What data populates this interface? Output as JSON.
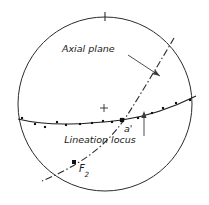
{
  "figure": {
    "width": 209,
    "height": 205,
    "background_color": "#ffffff",
    "line_color": "#1a1a1a",
    "point_color": "#111111"
  },
  "primitive_circle": {
    "name": "primitive-circle",
    "center_x": 105,
    "center_y": 104,
    "radius": 87,
    "stroke_color": "#2b2b2b",
    "stroke_width": 1
  },
  "north_tick": {
    "name": "north-tick",
    "x": 105,
    "y_top": 12,
    "y_bottom": 21
  },
  "center_cross": {
    "name": "center-cross",
    "x": 104,
    "y": 108,
    "size": 4
  },
  "labels": {
    "axial_plane": {
      "text": "Axial  plane",
      "x": 62,
      "y": 52,
      "font_size": 9.5
    },
    "lineation_locus": {
      "text": "Lineation   locus",
      "x": 100,
      "y": 143,
      "font_size": 9.5
    },
    "a_prime": {
      "text": "a'",
      "x": 124,
      "y": 132,
      "font_size": 9.5
    },
    "f2": {
      "text": "F",
      "subscript": "2",
      "x": 79,
      "y": 172,
      "font_size": 10
    }
  },
  "leaders": {
    "axial_plane_leader": {
      "name": "axial-plane-leader",
      "path": "M 128,55 L 160,76",
      "arrow_x": 160,
      "arrow_y": 76,
      "arrow_angle": 33
    },
    "lineation_leader": {
      "name": "lineation-locus-leader",
      "path": "M 144,136 L 144,113",
      "arrow_x": 144,
      "arrow_y": 111,
      "arrow_angle": -90
    }
  },
  "curves": {
    "lineation_locus_curve": {
      "name": "lineation-locus-curve",
      "style": "solid",
      "path": "M 18,119 C 50,127 88,124 122,120 C 150,116 178,105 196,96",
      "stroke_width": 1.1
    },
    "axial_plane_curve": {
      "name": "axial-plane-curve",
      "style": "dash-dot",
      "path": "M 174,38 C 160,62 142,92 128,114 C 112,138 92,160 42,181",
      "stroke_width": 1.1,
      "dash_pattern": "7,2.5,1.5,2.5"
    }
  },
  "key_points": [
    {
      "name": "point-a-prime",
      "label": "a'",
      "x": 122,
      "y": 120,
      "size": 4.2
    },
    {
      "name": "point-f2",
      "label": "F2",
      "x": 74,
      "y": 162,
      "size": 4.0
    }
  ],
  "data_points": {
    "name": "lineation-data-points",
    "count": 14,
    "marker_size": 2.1,
    "points": [
      {
        "x": 22,
        "y": 118
      },
      {
        "x": 35,
        "y": 124
      },
      {
        "x": 45,
        "y": 127
      },
      {
        "x": 57,
        "y": 122
      },
      {
        "x": 66,
        "y": 125
      },
      {
        "x": 80,
        "y": 124
      },
      {
        "x": 92,
        "y": 123
      },
      {
        "x": 103,
        "y": 121
      },
      {
        "x": 112,
        "y": 122
      },
      {
        "x": 138,
        "y": 118
      },
      {
        "x": 152,
        "y": 113
      },
      {
        "x": 163,
        "y": 108
      },
      {
        "x": 176,
        "y": 103
      },
      {
        "x": 190,
        "y": 100
      }
    ]
  },
  "chart_data": {
    "type": "scatter",
    "projection": "equal-area stereonet (lower hemisphere)",
    "xlabel": "",
    "ylabel": "",
    "grid": false,
    "legend_position": "inline-annotations",
    "annotations": [
      "Axial  plane",
      "Lineation   locus",
      "a'",
      "F2"
    ],
    "series": [
      {
        "name": "lineation measurements",
        "marker": "filled-square",
        "values": [
          [
            22,
            118
          ],
          [
            35,
            124
          ],
          [
            45,
            127
          ],
          [
            57,
            122
          ],
          [
            66,
            125
          ],
          [
            80,
            124
          ],
          [
            92,
            123
          ],
          [
            103,
            121
          ],
          [
            112,
            122
          ],
          [
            138,
            118
          ],
          [
            152,
            113
          ],
          [
            163,
            108
          ],
          [
            176,
            103
          ],
          [
            190,
            100
          ]
        ]
      },
      {
        "name": "key orientations",
        "marker": "large-filled-square",
        "values": [
          [
            122,
            120
          ],
          [
            74,
            162
          ]
        ],
        "labels": [
          "a'",
          "F2"
        ]
      }
    ]
  }
}
